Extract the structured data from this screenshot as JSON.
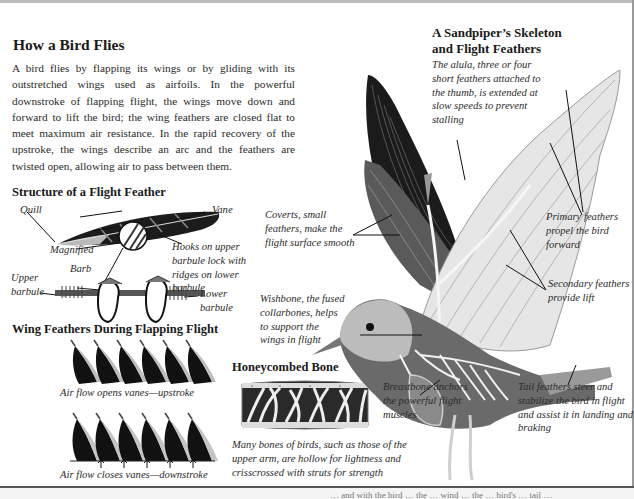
{
  "main": {
    "title": "How a Bird Flies",
    "intro": "A bird flies by flapping its wings or by gliding with its outstretched wings used as airfoils. In the powerful downstroke of flapping flight, the wings move down and forward to lift the bird; the wing feathers are closed flat to meet maximum air resistance. In the rapid recovery of the upstroke, the wings describe an arc and the feathers are twisted open, allowing air to pass between them."
  },
  "feather_structure": {
    "title": "Structure of a Flight Feather",
    "labels": {
      "quill": "Quill",
      "vane": "Vane",
      "magnified": "Magnified",
      "barb": "Barb",
      "hooks": "Hooks on upper barbule lock with ridges on lower barbule",
      "upper_barbule": "Upper barbule",
      "lower_barbule": "Lower barbule"
    }
  },
  "wing_feathers": {
    "title": "Wing Feathers During Flapping Flight",
    "upstroke_caption": "Air flow opens vanes—upstroke",
    "downstroke_caption": "Air flow closes vanes—downstroke"
  },
  "honeycombed_bone": {
    "title": "Honeycombed Bone",
    "caption": "Many bones of birds, such as those of the upper arm, are hollow for lightness and crisscrossed with struts for strength"
  },
  "sandpiper": {
    "title_line1": "A Sandpiper’s Skeleton",
    "title_line2": "and Flight Feathers",
    "alula": "The alula, three or four short feathers attached to the thumb, is extended at slow speeds to prevent stalling",
    "coverts": "Coverts, small feathers, make the flight surface smooth",
    "wishbone": "Wishbone, the fused collarbones, helps to support the wings in flight",
    "primary": "Primary feathers propel the bird forward",
    "secondary": "Secondary feathers provide lift",
    "breastbone": "Breastbone anchors the powerful flight muscles",
    "tail": "Tail feathers steer and stabilize the bird in flight and assist it in landing and braking"
  },
  "footer": {
    "cut_off_text": "… and with the bird … the … wind … the … bird's … tail …"
  }
}
